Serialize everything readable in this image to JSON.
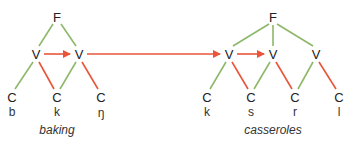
{
  "colors": {
    "green": "#8db86a",
    "red": "#e8553a"
  },
  "trees": [
    {
      "id": "baking",
      "word": "baking",
      "foot": {
        "label": "F",
        "x": 57,
        "y": 17
      },
      "vowels": [
        {
          "label": "V",
          "x": 36,
          "y": 54
        },
        {
          "label": "V",
          "x": 79,
          "y": 54
        }
      ],
      "consonants": [
        {
          "label": "C",
          "segment": "b",
          "x": 12,
          "y": 97
        },
        {
          "label": "C",
          "segment": "k",
          "x": 57,
          "y": 97
        },
        {
          "label": "C",
          "segment": "ŋ",
          "x": 101,
          "y": 97
        }
      ],
      "word_pos": {
        "x": 57,
        "y": 130
      }
    },
    {
      "id": "casseroles",
      "word": "casseroles",
      "foot": {
        "label": "F",
        "x": 273,
        "y": 17
      },
      "vowels": [
        {
          "label": "V",
          "x": 229,
          "y": 54
        },
        {
          "label": "V",
          "x": 273,
          "y": 54
        },
        {
          "label": "V",
          "x": 316,
          "y": 54
        }
      ],
      "consonants": [
        {
          "label": "C",
          "segment": "k",
          "x": 207,
          "y": 97
        },
        {
          "label": "C",
          "segment": "s",
          "x": 251,
          "y": 97
        },
        {
          "label": "C",
          "segment": "r",
          "x": 295,
          "y": 97
        },
        {
          "label": "C",
          "segment": "l",
          "x": 339,
          "y": 97
        }
      ],
      "word_pos": {
        "x": 273,
        "y": 130
      }
    }
  ],
  "labels": {
    "f1": "F",
    "v1a": "V",
    "v1b": "V",
    "c1a": "C",
    "c1b": "C",
    "c1c": "C",
    "s1a": "b",
    "s1b": "k",
    "s1c": "ŋ",
    "w1": "baking",
    "f2": "F",
    "v2a": "V",
    "v2b": "V",
    "v2c": "V",
    "c2a": "C",
    "c2b": "C",
    "c2c": "C",
    "c2d": "C",
    "s2a": "k",
    "s2b": "s",
    "s2c": "r",
    "s2d": "l",
    "w2": "casseroles"
  }
}
